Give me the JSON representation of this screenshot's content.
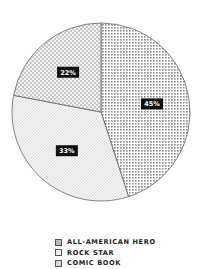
{
  "chart_data": {
    "type": "pie",
    "title": "",
    "slices": [
      {
        "label": "ALL-AMERICAN HERO",
        "value": 45,
        "display": "45%",
        "pattern": "dots"
      },
      {
        "label": "ROCK STAR",
        "value": 33,
        "display": "33%",
        "pattern": "lines"
      },
      {
        "label": "COMIC BOOK",
        "value": 22,
        "display": "22%",
        "pattern": "checker"
      }
    ],
    "start_angle": "12 o'clock",
    "direction": "clockwise",
    "legend_position": "bottom-center"
  },
  "legend": {
    "items": [
      {
        "label": "ALL-AMERICAN HERO"
      },
      {
        "label": "ROCK STAR"
      },
      {
        "label": "COMIC BOOK"
      }
    ]
  },
  "colors": {
    "label_bg": "#111111",
    "label_text": "#ffffff",
    "outline": "#666666"
  }
}
